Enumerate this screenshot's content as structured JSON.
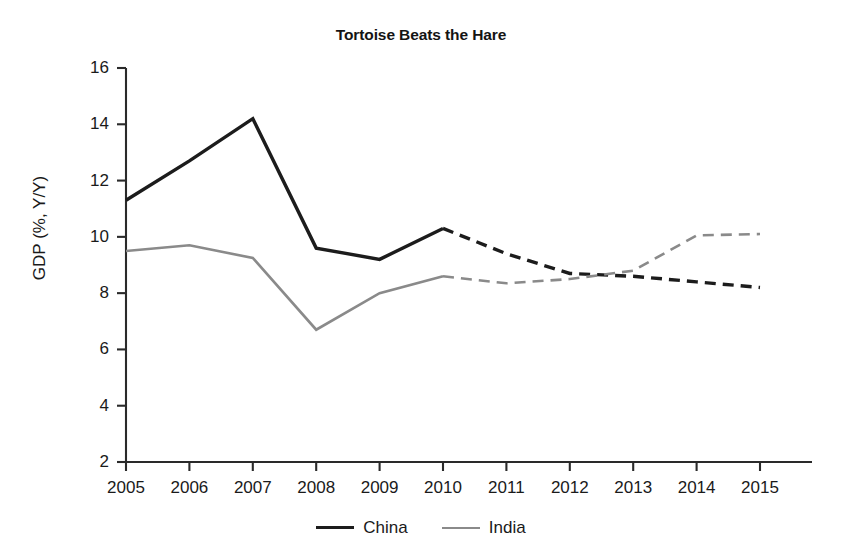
{
  "chart_data": {
    "type": "line",
    "title": "Tortoise Beats the Hare",
    "xlabel": "",
    "ylabel": "GDP (%, Y/Y)",
    "x": [
      2005,
      2006,
      2007,
      2008,
      2009,
      2010,
      2011,
      2012,
      2013,
      2014,
      2015
    ],
    "categories": [
      "2005",
      "2006",
      "2007",
      "2008",
      "2009",
      "2010",
      "2011",
      "2012",
      "2013",
      "2014",
      "2015"
    ],
    "xlim": [
      2005,
      2015
    ],
    "ylim": [
      2,
      16
    ],
    "yticks": [
      2,
      4,
      6,
      8,
      10,
      12,
      14,
      16
    ],
    "ytick_labels": [
      "2",
      "4",
      "6",
      "8",
      "10",
      "12",
      "14",
      "16"
    ],
    "grid": false,
    "legend_position": "bottom-center",
    "forecast_starts_at": 2010,
    "series": [
      {
        "name": "China",
        "color": "#1c1c1c",
        "line_width": 3.4,
        "values": [
          11.3,
          12.7,
          14.2,
          9.6,
          9.2,
          10.3,
          9.4,
          8.7,
          8.6,
          8.4,
          8.2
        ]
      },
      {
        "name": "India",
        "color": "#8a8a8a",
        "line_width": 2.6,
        "values": [
          9.5,
          9.7,
          9.25,
          6.7,
          8.0,
          8.6,
          8.35,
          8.5,
          8.8,
          10.05,
          10.1
        ]
      }
    ]
  },
  "legend": {
    "entries": [
      {
        "label": "China",
        "swatch": "solid-black-line"
      },
      {
        "label": "India",
        "swatch": "solid-gray-line"
      }
    ]
  },
  "axes": {
    "y_label": "GDP (%, Y/Y)",
    "y_ticks": [
      "2",
      "4",
      "6",
      "8",
      "10",
      "12",
      "14",
      "16"
    ],
    "x_ticks": [
      "2005",
      "2006",
      "2007",
      "2008",
      "2009",
      "2010",
      "2011",
      "2012",
      "2013",
      "2014",
      "2015"
    ]
  },
  "colors": {
    "china": "#1c1c1c",
    "india": "#8a8a8a",
    "axis": "#2a2a2a",
    "background": "#ffffff"
  }
}
